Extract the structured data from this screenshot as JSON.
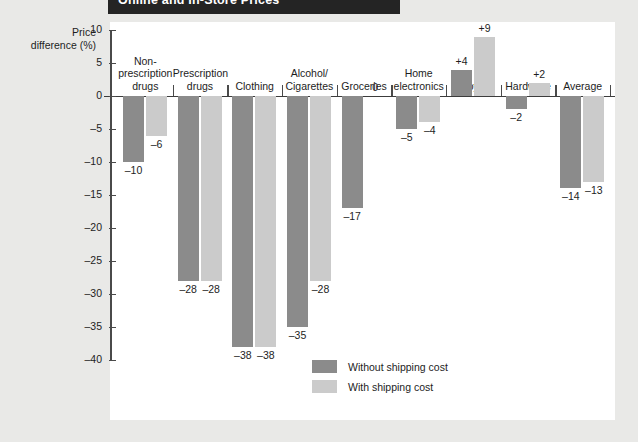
{
  "title_band": {
    "text": "Online and In-Store Prices"
  },
  "axis_title": {
    "line1": "Price",
    "line2": "difference (%)"
  },
  "legend": {
    "items": [
      {
        "label": "Without shipping cost",
        "swatch": "dark",
        "color": "#8b8b8b"
      },
      {
        "label": "With shipping cost",
        "swatch": "light",
        "color": "#cbcbcb"
      }
    ]
  },
  "chart_data": {
    "type": "bar",
    "title": "Online and In-Store Prices",
    "xlabel": "",
    "ylabel": "Price difference (%)",
    "ylim": [
      -40,
      10
    ],
    "yticks": [
      10,
      5,
      0,
      -5,
      -10,
      -15,
      -20,
      -25,
      -30,
      -35,
      -40
    ],
    "ytick_labels": [
      "10",
      "5",
      "0",
      "–5",
      "–10",
      "–15",
      "–20",
      "–25",
      "–30",
      "–35",
      "–40"
    ],
    "grid": false,
    "legend_position": "bottom-center",
    "categories": [
      "Non-prescription drugs",
      "Prescription drugs",
      "Clothing",
      "Alcohol/Cigarettes",
      "Groceries",
      "Home electronics",
      "Toys",
      "Hardware",
      "Average"
    ],
    "category_label_lines": [
      [
        "Non-",
        "prescription",
        "drugs"
      ],
      [
        "Prescription",
        "drugs"
      ],
      [
        "Clothing"
      ],
      [
        "Alcohol/",
        "Cigarettes"
      ],
      [
        "Groceries"
      ],
      [
        "Home",
        "electronics"
      ],
      [
        "Toys"
      ],
      [
        "Hardware"
      ],
      [
        "Average"
      ]
    ],
    "series": [
      {
        "name": "Without shipping cost",
        "color": "#8b8b8b",
        "values": [
          -10,
          -28,
          -38,
          -35,
          -17,
          -5,
          4,
          -2,
          -14
        ],
        "value_labels": [
          "–10",
          "–28",
          "–38",
          "–35",
          "–17",
          "–5",
          "+4",
          "–2",
          "–14"
        ]
      },
      {
        "name": "With shipping cost",
        "color": "#cbcbcb",
        "values": [
          -6,
          -28,
          -38,
          -28,
          0,
          -4,
          9,
          2,
          -13
        ],
        "value_labels": [
          "–6",
          "–28",
          "–38",
          "–28",
          "0",
          "–4",
          "+9",
          "+2",
          "–13"
        ]
      }
    ]
  }
}
